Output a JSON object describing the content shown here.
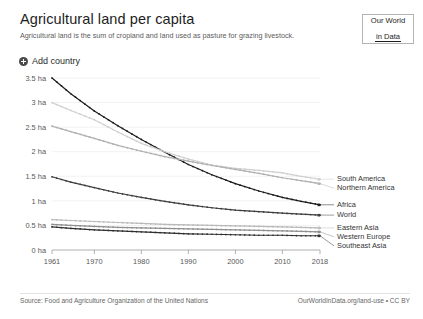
{
  "header": {
    "title": "Agricultural land per capita",
    "subtitle": "Agricultural land is the sum of cropland and land used as pasture for grazing livestock.",
    "logo_line1": "Our World",
    "logo_line2": "in Data"
  },
  "controls": {
    "add_country_label": "Add country",
    "add_country_icon": "plus-circle-icon"
  },
  "footer": {
    "source": "Source: Food and Agriculture Organization of the United Nations",
    "link": "OurWorldInData.org/land-use • CC BY"
  },
  "colors": {
    "africa": "#1b1b1b",
    "world": "#3d3d3d",
    "southeast_asia": "#2f2f2f",
    "western_europe": "#8f8f8f",
    "eastern_asia": "#b9b9b9",
    "northern_america": "#b0b0b0",
    "south_america": "#d0d0d0",
    "grid": "#f2f2f2",
    "axis": "#b0b0b0",
    "text": "#575757"
  },
  "chart_data": {
    "type": "line",
    "title": "Agricultural land per capita",
    "subtitle": "Agricultural land is the sum of cropland and land used as pasture for grazing livestock.",
    "xlabel": "",
    "ylabel": "",
    "unit": "ha",
    "xlim": [
      1961,
      2018
    ],
    "ylim": [
      0,
      3.5
    ],
    "grid": true,
    "legend_position": "right-inline",
    "x_ticks": [
      1961,
      1970,
      1980,
      1990,
      2000,
      2010,
      2018
    ],
    "x_tick_labels": [
      "1961",
      "1970",
      "1980",
      "1990",
      "2000",
      "2010",
      "2018"
    ],
    "y_ticks": [
      0,
      0.5,
      1,
      1.5,
      2,
      2.5,
      3,
      3.5
    ],
    "y_tick_labels": [
      "0 ha",
      "0.5 ha",
      "1 ha",
      "1.5 ha",
      "2 ha",
      "2.5 ha",
      "3 ha",
      "3.5 ha"
    ],
    "x": [
      1961,
      1965,
      1970,
      1975,
      1980,
      1985,
      1990,
      1995,
      2000,
      2005,
      2010,
      2014,
      2018
    ],
    "series": [
      {
        "name": "Africa",
        "color": "#1b1b1b",
        "label_color": "#1b1b1b",
        "values": [
          3.5,
          3.18,
          2.83,
          2.53,
          2.25,
          1.99,
          1.74,
          1.53,
          1.35,
          1.2,
          1.07,
          0.99,
          0.92
        ],
        "end_value": 0.92
      },
      {
        "name": "South America",
        "color": "#d0d0d0",
        "label_color": "#cfcfcf",
        "values": [
          3.0,
          2.84,
          2.65,
          2.4,
          2.17,
          2.0,
          1.85,
          1.73,
          1.66,
          1.62,
          1.57,
          1.5,
          1.44
        ],
        "end_value": 1.44
      },
      {
        "name": "Northern America",
        "color": "#b0b0b0",
        "label_color": "#b5b5b5",
        "values": [
          2.52,
          2.41,
          2.27,
          2.13,
          2.01,
          1.9,
          1.81,
          1.72,
          1.64,
          1.56,
          1.47,
          1.41,
          1.35
        ],
        "end_value": 1.35
      },
      {
        "name": "World",
        "color": "#3d3d3d",
        "label_color": "#3d3d3d",
        "values": [
          1.49,
          1.38,
          1.27,
          1.16,
          1.07,
          0.99,
          0.92,
          0.86,
          0.81,
          0.78,
          0.75,
          0.73,
          0.71
        ],
        "end_value": 0.71
      },
      {
        "name": "Eastern Asia",
        "color": "#b9b9b9",
        "label_color": "#bdbdbd",
        "values": [
          0.62,
          0.6,
          0.58,
          0.56,
          0.54,
          0.52,
          0.51,
          0.5,
          0.49,
          0.48,
          0.47,
          0.46,
          0.45
        ],
        "end_value": 0.45
      },
      {
        "name": "Western Europe",
        "color": "#8f8f8f",
        "label_color": "#8f8f8f",
        "values": [
          0.52,
          0.5,
          0.48,
          0.46,
          0.45,
          0.44,
          0.43,
          0.42,
          0.41,
          0.4,
          0.39,
          0.38,
          0.37
        ],
        "end_value": 0.37
      },
      {
        "name": "Southeast Asia",
        "color": "#2f2f2f",
        "label_color": "#2f2f2f",
        "values": [
          0.47,
          0.44,
          0.41,
          0.39,
          0.37,
          0.35,
          0.33,
          0.32,
          0.31,
          0.3,
          0.3,
          0.29,
          0.29
        ],
        "end_value": 0.29
      }
    ],
    "legend": [
      {
        "name": "South America",
        "color": "#d0d0d0"
      },
      {
        "name": "Northern America",
        "color": "#b0b0b0"
      },
      {
        "name": "Africa",
        "color": "#1b1b1b"
      },
      {
        "name": "World",
        "color": "#3d3d3d"
      },
      {
        "name": "Eastern Asia",
        "color": "#b9b9b9"
      },
      {
        "name": "Western Europe",
        "color": "#8f8f8f"
      },
      {
        "name": "Southeast Asia",
        "color": "#2f2f2f"
      }
    ]
  }
}
